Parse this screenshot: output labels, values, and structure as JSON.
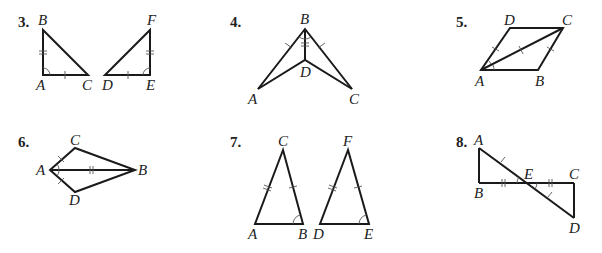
{
  "problems": [
    {
      "number": "3.",
      "figures": [
        {
          "vertices": {
            "B": [
              43,
              30
            ],
            "A": [
              43,
              75
            ],
            "C": [
              88,
              75
            ]
          }
        },
        {
          "vertices": {
            "F": [
              150,
              30
            ],
            "E": [
              150,
              75
            ],
            "D": [
              105,
              75
            ]
          }
        }
      ],
      "labels": {
        "B": "B",
        "A": "A",
        "C": "C",
        "D": "D",
        "E": "E",
        "F": "F"
      },
      "markings": "AB ≅ EF (double tick), AC ≅ DE (single tick), right-angle arcs at A and E"
    },
    {
      "number": "4.",
      "vertices": {
        "B": [
          305,
          29
        ],
        "D": [
          305,
          60
        ],
        "A": [
          258,
          89
        ],
        "C": [
          352,
          89
        ]
      },
      "labels": {
        "A": "A",
        "B": "B",
        "C": "C",
        "D": "D"
      },
      "markings": "BA ≅ BC (single tick), BD shared (double tick), angle ABD ≅ angle CBD (arcs)"
    },
    {
      "number": "5.",
      "vertices": {
        "A": [
          481,
          70
        ],
        "B": [
          538,
          70
        ],
        "C": [
          563,
          28
        ],
        "D": [
          510,
          28
        ]
      },
      "labels": {
        "A": "A",
        "B": "B",
        "C": "C",
        "D": "D"
      },
      "markings": "AD ≅ BC (single tick), diagonal AC (tick), angle DAC ≅ angle BAC (arcs)"
    },
    {
      "number": "6.",
      "vertices": {
        "A": [
          50,
          170
        ],
        "C": [
          75,
          148
        ],
        "B": [
          135,
          170
        ],
        "D": [
          75,
          192
        ]
      },
      "labels": {
        "A": "A",
        "B": "B",
        "C": "C",
        "D": "D"
      },
      "markings": "AC ≅ AD (single tick), AB shared (double tick), angle CAB ≅ angle DAB (arcs)"
    },
    {
      "number": "7.",
      "figures": [
        {
          "vertices": {
            "C": [
              283,
              150
            ],
            "A": [
              255,
              224
            ],
            "B": [
              303,
              224
            ]
          }
        },
        {
          "vertices": {
            "F": [
              348,
              150
            ],
            "D": [
              320,
              224
            ],
            "E": [
              369,
              224
            ]
          }
        }
      ],
      "labels": {
        "A": "A",
        "B": "B",
        "C": "C",
        "D": "D",
        "E": "E",
        "F": "F"
      },
      "markings": "AC ≅ DF (double tick), BC ≅ EF (single tick), angle B ≅ angle E (arcs)"
    },
    {
      "number": "8.",
      "vertices": {
        "A": [
          479,
          148
        ],
        "B": [
          479,
          183
        ],
        "E": [
          527,
          183
        ],
        "C": [
          574,
          183
        ],
        "D": [
          574,
          218
        ]
      },
      "labels": {
        "A": "A",
        "B": "B",
        "C": "C",
        "D": "D",
        "E": "E"
      },
      "markings": "AE ≅ ED (single tick), BE ≅ EC (double tick), vertical angles at E (arcs)"
    }
  ]
}
